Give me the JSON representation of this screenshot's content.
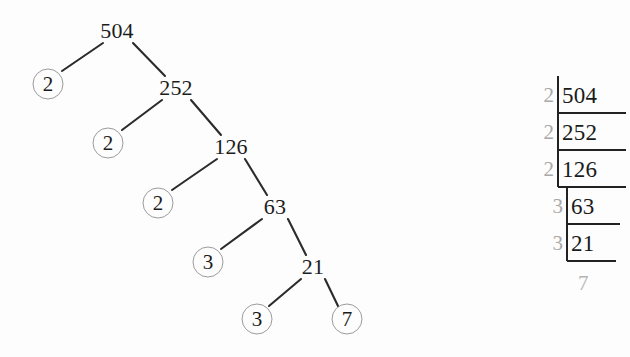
{
  "figure": {
    "colors": {
      "edge": "#2b2b2b",
      "node_text": "#1c1c1c",
      "leaf_circle": "#9b9b9b",
      "divisor_grey": "#a9a9a9",
      "dividend_dark": "#1a1a1a",
      "ladder_rule": "#222222",
      "background": "#fdfdfd"
    }
  },
  "tree": {
    "name": "factor-tree",
    "internal_nodes": [
      {
        "id": "n504",
        "label": "504",
        "x": 117,
        "y": 31
      },
      {
        "id": "n252",
        "label": "252",
        "x": 176,
        "y": 88
      },
      {
        "id": "n126",
        "label": "126",
        "x": 231,
        "y": 147
      },
      {
        "id": "n63",
        "label": "63",
        "x": 275,
        "y": 207
      },
      {
        "id": "n21",
        "label": "21",
        "x": 313,
        "y": 267
      }
    ],
    "leaf_nodes": [
      {
        "id": "l1",
        "label": "2",
        "x": 48,
        "y": 84
      },
      {
        "id": "l2",
        "label": "2",
        "x": 108,
        "y": 143
      },
      {
        "id": "l3",
        "label": "2",
        "x": 158,
        "y": 203
      },
      {
        "id": "l4",
        "label": "3",
        "x": 208,
        "y": 262
      },
      {
        "id": "l5",
        "label": "3",
        "x": 257,
        "y": 319
      },
      {
        "id": "l6",
        "label": "7",
        "x": 347,
        "y": 319
      }
    ],
    "edges": [
      {
        "from": "n504",
        "to": "l1",
        "x1": 103,
        "y1": 43,
        "x2": 62,
        "y2": 71
      },
      {
        "from": "n504",
        "to": "n252",
        "x1": 133,
        "y1": 43,
        "x2": 165,
        "y2": 76
      },
      {
        "from": "n252",
        "to": "l2",
        "x1": 162,
        "y1": 100,
        "x2": 122,
        "y2": 130
      },
      {
        "from": "n252",
        "to": "n126",
        "x1": 191,
        "y1": 100,
        "x2": 221,
        "y2": 135
      },
      {
        "from": "n126",
        "to": "l3",
        "x1": 217,
        "y1": 159,
        "x2": 172,
        "y2": 190
      },
      {
        "from": "n126",
        "to": "n63",
        "x1": 245,
        "y1": 159,
        "x2": 267,
        "y2": 195
      },
      {
        "from": "n63",
        "to": "l4",
        "x1": 262,
        "y1": 219,
        "x2": 221,
        "y2": 249
      },
      {
        "from": "n63",
        "to": "n21",
        "x1": 288,
        "y1": 219,
        "x2": 306,
        "y2": 255
      },
      {
        "from": "n21",
        "to": "l5",
        "x1": 301,
        "y1": 279,
        "x2": 269,
        "y2": 306
      },
      {
        "from": "n21",
        "to": "l6",
        "x1": 325,
        "y1": 279,
        "x2": 338,
        "y2": 306
      }
    ]
  },
  "ladder": {
    "name": "division-ladder",
    "rows": [
      {
        "divisor": "2",
        "dividend": "504",
        "top": 0,
        "bar_left": 28,
        "text_left": 32,
        "rule_right": 96
      },
      {
        "divisor": "2",
        "dividend": "252",
        "top": 37,
        "bar_left": 28,
        "text_left": 32,
        "rule_right": 96
      },
      {
        "divisor": "2",
        "dividend": "126",
        "top": 74,
        "bar_left": 28,
        "text_left": 32,
        "rule_right": 96
      },
      {
        "divisor": "3",
        "dividend": "63",
        "top": 111,
        "bar_left": 37,
        "text_left": 41,
        "rule_right": 90
      },
      {
        "divisor": "3",
        "dividend": "21",
        "top": 148,
        "bar_left": 37,
        "text_left": 41,
        "rule_right": 86
      }
    ],
    "final_quotient": "7",
    "final_quotient_left": 48,
    "final_quotient_top": 197
  }
}
